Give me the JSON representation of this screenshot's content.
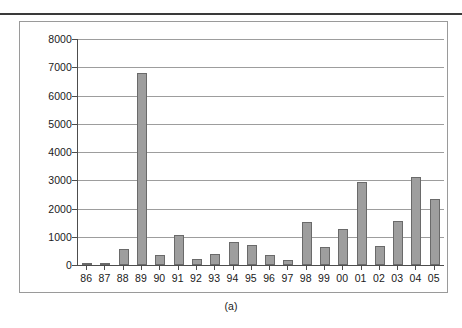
{
  "figure": {
    "caption": "(a)"
  },
  "chart_data": {
    "type": "bar",
    "title": "",
    "xlabel": "",
    "ylabel": "",
    "categories": [
      "86",
      "87",
      "88",
      "89",
      "90",
      "91",
      "92",
      "93",
      "94",
      "95",
      "96",
      "97",
      "98",
      "99",
      "00",
      "01",
      "02",
      "03",
      "04",
      "05"
    ],
    "values": [
      50,
      55,
      560,
      6800,
      350,
      1070,
      200,
      380,
      810,
      720,
      340,
      170,
      1520,
      650,
      1270,
      2950,
      680,
      1560,
      3100,
      2330
    ],
    "ylim": [
      0,
      8000
    ],
    "yticks": [
      0,
      1000,
      2000,
      3000,
      4000,
      5000,
      6000,
      7000,
      8000
    ],
    "ytick_labels": [
      "0",
      "1000",
      "2000",
      "3000",
      "4000",
      "5000",
      "6000",
      "7000",
      "8000"
    ],
    "grid": true,
    "legend": null,
    "bar_color": "#9e9e9e",
    "bar_border_color": "#6a6a6a",
    "grid_color": "#9d9d9d",
    "axis_color": "#4d4d4d"
  }
}
